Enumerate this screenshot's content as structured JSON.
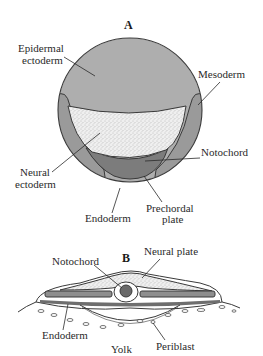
{
  "figure": {
    "panel_a": {
      "title": "A",
      "labels": {
        "epidermal_ectoderm": [
          "Epidermal",
          "ectoderm"
        ],
        "mesoderm": "Mesoderm",
        "notochord": "Notochord",
        "neural_ectoderm": [
          "Neural",
          "ectoderm"
        ],
        "endoderm": "Endoderm",
        "prechordal_plate": [
          "Prechordal",
          "plate"
        ]
      }
    },
    "panel_b": {
      "title": "B",
      "labels": {
        "notochord": "Notochord",
        "neural_plate": "Neural plate",
        "endoderm": "Endoderm",
        "yolk": "Yolk",
        "periblast": "Periblast"
      }
    },
    "colors": {
      "epidermal_ectoderm": "#aeaeae",
      "mesoderm": "#9a9a9a",
      "notochord": "#7c7c7c",
      "neural_ectoderm": "#ececec",
      "endoderm": "#f4f4f4",
      "outline": "#3a3a3a"
    }
  }
}
